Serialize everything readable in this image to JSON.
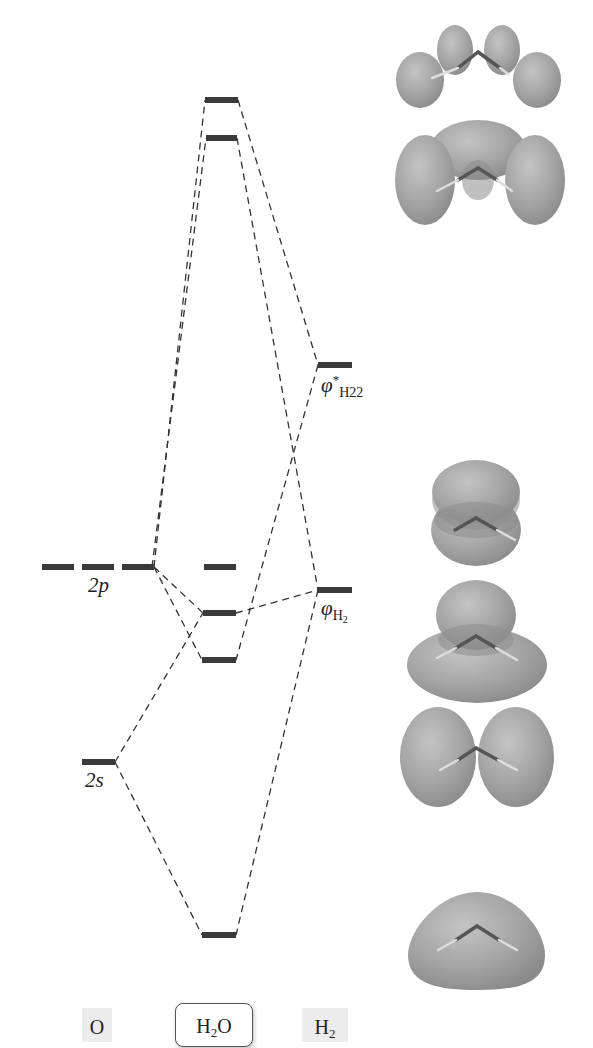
{
  "diagram": {
    "columns": [
      {
        "id": "O",
        "label": "O",
        "sub": ""
      },
      {
        "id": "H2O",
        "label_main": "H",
        "label_sub": "2",
        "label_tail": "O"
      },
      {
        "id": "H2",
        "label_main": "H",
        "label_sub": "2"
      }
    ],
    "atomic_levels": {
      "O_2p": {
        "label": "2p",
        "y": 567,
        "count": 3
      },
      "O_2s": {
        "label": "2s",
        "y": 762,
        "count": 1
      }
    },
    "fragment_levels": {
      "phi_H2_star": {
        "label_phi": "φ",
        "label_sub": "H22",
        "label_sup": "*",
        "y": 365
      },
      "phi_H2": {
        "label_phi": "φ",
        "label_sub": "H2",
        "y": 590
      }
    },
    "molecular_levels_H2O_y": [
      100,
      138,
      567,
      613,
      660,
      935
    ],
    "orbital_images": [
      {
        "name": "antibonding-2",
        "y": 70
      },
      {
        "name": "antibonding-1",
        "y": 175
      },
      {
        "name": "nonbonding-2p",
        "y": 525
      },
      {
        "name": "bonding-3",
        "y": 628
      },
      {
        "name": "bonding-2",
        "y": 760
      },
      {
        "name": "bonding-1",
        "y": 965
      }
    ],
    "colors": {
      "level": "#3a3a3a",
      "orbital": "#9a9a9a",
      "line": "#333333"
    }
  },
  "labels": {
    "o2p": "2p",
    "o2s": "2s",
    "phi": "φ",
    "star": "*",
    "h2star_sub": "H22",
    "h2_sub_h": "H",
    "h2_sub_2": "2",
    "species_o": "O",
    "species_h2o_h": "H",
    "species_h2o_2": "2",
    "species_h2o_o": "O",
    "species_h2_h": "H",
    "species_h2_2": "2"
  }
}
